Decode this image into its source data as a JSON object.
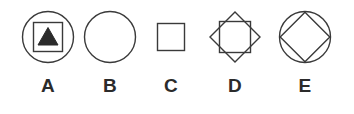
{
  "figure": {
    "background_color": "#ffffff",
    "stroke_color": "#3a3a3a",
    "fill_color": "#2b2b2b",
    "label_color": "#2b2b2b",
    "options": [
      {
        "label": "A",
        "name": "option-a",
        "description": "circle containing a square containing a filled upward triangle",
        "shapes": [
          "circle",
          "square",
          "triangle-up-filled"
        ]
      },
      {
        "label": "B",
        "name": "option-b",
        "description": "plain circle",
        "shapes": [
          "circle"
        ]
      },
      {
        "label": "C",
        "name": "option-c",
        "description": "plain small square",
        "shapes": [
          "square"
        ]
      },
      {
        "label": "D",
        "name": "option-d",
        "description": "diamond containing an upright square",
        "shapes": [
          "diamond",
          "square"
        ]
      },
      {
        "label": "E",
        "name": "option-e",
        "description": "circle containing an inscribed diamond",
        "shapes": [
          "circle",
          "diamond"
        ]
      }
    ]
  }
}
